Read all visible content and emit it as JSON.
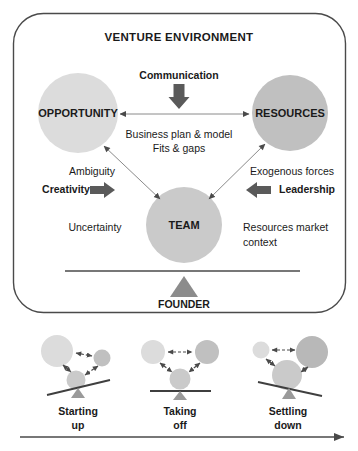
{
  "diagram": {
    "title": "VENTURE ENVIRONMENT",
    "nodes": {
      "opportunity": "OPPORTUNITY",
      "resources": "RESOURCES",
      "team": "TEAM"
    },
    "fulcrum_label": "FOUNDER",
    "annotations": {
      "top_arrow": "Communication",
      "center_line1": "Business plan & model",
      "center_line2": "Fits & gaps",
      "left_upper": "Ambiguity",
      "left_arrow": "Creativity",
      "left_lower": "Uncertainty",
      "right_upper": "Exogenous forces",
      "right_arrow": "Leadership",
      "right_lower_line1": "Resources market",
      "right_lower_line2": "context"
    }
  },
  "stages": [
    {
      "id": "starting-up",
      "label_line1": "Starting",
      "label_line2": "up"
    },
    {
      "id": "taking-off",
      "label_line1": "Taking",
      "label_line2": "off"
    },
    {
      "id": "settling-down",
      "label_line1": "Settling",
      "label_line2": "down"
    }
  ],
  "colors": {
    "circle_light": "#dcdcdc",
    "circle_medium": "#c4c4c4",
    "circle_dark": "#a8a8a8",
    "stroke": "#555555",
    "text": "#1a1a1a",
    "arrow_fill": "#5a5a5a",
    "triangle": "#8c8c8c"
  }
}
